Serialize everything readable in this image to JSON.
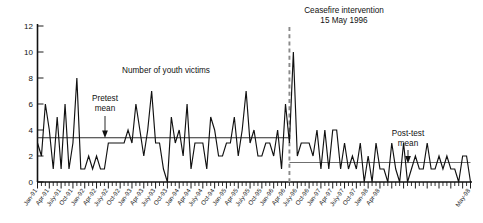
{
  "chart_data": {
    "type": "line",
    "title": "",
    "xlabel": "",
    "ylabel": "",
    "ylim": [
      0,
      12
    ],
    "yticks": [
      0,
      2,
      4,
      6,
      8,
      10,
      12
    ],
    "grid": false,
    "legend_position": "none",
    "series_label": "Number of youth victims",
    "x_start": "Jan-91",
    "x_end": "May-98",
    "x_tick_labels": [
      "Jan-91",
      "Apr-91",
      "July-91",
      "Oct-91",
      "Jan-92",
      "Apr-92",
      "July-92",
      "Oct-92",
      "Jan-93",
      "Apr-93",
      "July-93",
      "Oct-93",
      "Jan-94",
      "Apr-94",
      "July-94",
      "Oct-94",
      "Jan-95",
      "Apr-95",
      "July-95",
      "Oct-95",
      "Jan-96",
      "Apr-96",
      "July-96",
      "Oct-96",
      "Jan-97",
      "Apr-97",
      "July-97",
      "Oct-97",
      "Jan-98",
      "Apr-98",
      "May-98"
    ],
    "series": [
      {
        "name": "Number of youth victims",
        "values": [
          3,
          2,
          6,
          4,
          1,
          5,
          1,
          6,
          1,
          3,
          8,
          1,
          1,
          2,
          1,
          2,
          1,
          1,
          3,
          3,
          3,
          3,
          3,
          4,
          3,
          6,
          4,
          2,
          4,
          7,
          3,
          3,
          1,
          0,
          5,
          3,
          4,
          2,
          6,
          1,
          3,
          3,
          3,
          1,
          5,
          4,
          2,
          2,
          3,
          3,
          5,
          2,
          4,
          7,
          3,
          4,
          2,
          2,
          3,
          3,
          2,
          4,
          1,
          6,
          3,
          10,
          2,
          3,
          3,
          3,
          2,
          4,
          1,
          4,
          1,
          4,
          4,
          1,
          3,
          1,
          2,
          1,
          3,
          0,
          2,
          0,
          3,
          1,
          1,
          0,
          3,
          1,
          0,
          3,
          0,
          1,
          2,
          1,
          1,
          3,
          1,
          1,
          2,
          1,
          2,
          1,
          1,
          0,
          2,
          2,
          0
        ]
      }
    ],
    "reference_lines": [
      {
        "name": "Pretest mean",
        "value": 3.4,
        "span": "pre-intervention"
      },
      {
        "name": "Post-test mean",
        "value": 1.5,
        "span": "post-intervention"
      }
    ],
    "annotations": [
      {
        "name": "series-label",
        "text": "Number of youth victims"
      },
      {
        "name": "pretest-mean-label",
        "line1": "Pretest",
        "line2": "mean"
      },
      {
        "name": "posttest-mean-label",
        "line1": "Post-test",
        "line2": "mean"
      },
      {
        "name": "intervention-label",
        "line1": "Ceasefire intervention",
        "line2": "15 May 1996"
      }
    ],
    "intervention": {
      "label": "Ceasefire intervention",
      "date": "15 May 1996",
      "style": "dashed-vertical",
      "color": "#8a8a8a"
    },
    "colors": {
      "series": "#111111",
      "pretest_mean": "#2b2b2b",
      "posttest_mean": "#6f6f6f",
      "intervention": "#8a8a8a",
      "axis": "#111111",
      "background": "#ffffff"
    }
  }
}
